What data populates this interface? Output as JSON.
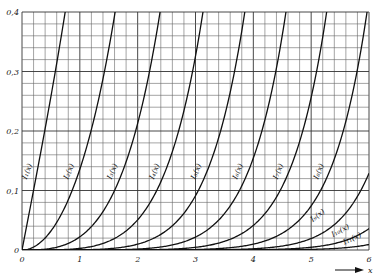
{
  "chart_data": {
    "type": "line",
    "title": "",
    "xlabel": "x",
    "ylabel": "",
    "xlim": [
      0,
      6
    ],
    "ylim": [
      0,
      0.4
    ],
    "grid": true,
    "x_ticks": [
      "0",
      "1",
      "2",
      "3",
      "4",
      "5",
      "6"
    ],
    "y_ticks": [
      "0",
      "0,1",
      "0,2",
      "0,3",
      "0,4"
    ],
    "x_minor_step": 0.2,
    "y_minor_step": 0.02,
    "legend": "inline labels on curves",
    "series": [
      {
        "name": "I1(x)",
        "label": "I₁(x)",
        "order": 1
      },
      {
        "name": "I2(x)",
        "label": "I₂(x)",
        "order": 2
      },
      {
        "name": "I3(x)",
        "label": "I₃(x)",
        "order": 3
      },
      {
        "name": "I4(x)",
        "label": "I₄(x)",
        "order": 4
      },
      {
        "name": "I5(x)",
        "label": "I₅(x)",
        "order": 5
      },
      {
        "name": "I6(x)",
        "label": "I₆(x)",
        "order": 6
      },
      {
        "name": "I7(x)",
        "label": "I₇(x)",
        "order": 7
      },
      {
        "name": "I8(x)",
        "label": "I₈(x)",
        "order": 8
      },
      {
        "name": "I9(x)",
        "label": "I₉(x)",
        "order": 9
      },
      {
        "name": "I10(x)",
        "label": "I₁₀(x)",
        "order": 10
      },
      {
        "name": "I11(x)",
        "label": "I₁₁(x)",
        "order": 11
      }
    ],
    "sample_points": {
      "I1": {
        "x": [
          0,
          0.4,
          0.8
        ],
        "y": [
          0,
          0.204,
          0.433
        ]
      },
      "I2": {
        "x": [
          0,
          1.0,
          1.8
        ],
        "y": [
          0,
          0.136,
          0.437
        ]
      },
      "I3": {
        "x": [
          0,
          2.0,
          2.6
        ],
        "y": [
          0,
          0.213,
          0.42
        ]
      },
      "I11": {
        "x": [
          0,
          5.5,
          6.0
        ],
        "y": [
          0,
          0.011,
          0.022
        ]
      }
    },
    "function": "modified Bessel function of the first kind I_n(x)"
  },
  "axis": {
    "x_arrow_label": "x"
  }
}
